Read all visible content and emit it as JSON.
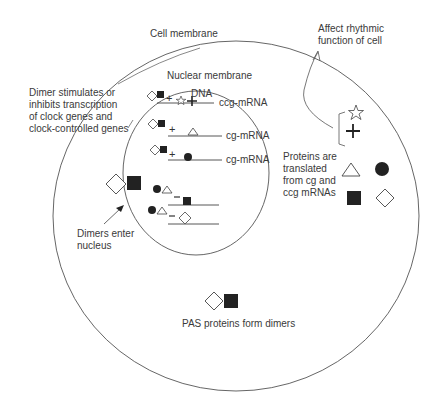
{
  "diagram": {
    "labels": {
      "cell_membrane": "Cell membrane",
      "nuclear_membrane": "Nuclear membrane",
      "dna": "DNA",
      "dimer_stimulates": [
        "Dimer stimulates or",
        "inhibits transcription",
        "of clock genes and",
        "clock-controlled genes"
      ],
      "affect_rhythmic": [
        "Affect rhythmic",
        "function of cell"
      ],
      "proteins_translated": [
        "Proteins are",
        "translated",
        "from cg and",
        "ccg mRNAs"
      ],
      "dimers_enter": [
        "Dimers enter",
        "nucleus"
      ],
      "pas_dimers": "PAS proteins form dimers"
    },
    "genes": [
      {
        "mrna_label": "ccg-mRNA",
        "regulation": "+",
        "product": "star-and-cross"
      },
      {
        "mrna_label": "cg-mRNA",
        "regulation": "+",
        "product": "triangle"
      },
      {
        "mrna_label": "cg-mRNA",
        "regulation": "+",
        "product": "circle"
      },
      {
        "mrna_label": "",
        "regulation": "−",
        "product": "square"
      },
      {
        "mrna_label": "",
        "regulation": "−",
        "product": "diamond"
      }
    ],
    "colors": {
      "line": "#555555",
      "fill_dark": "#222222",
      "text": "#3a3a3a"
    }
  }
}
